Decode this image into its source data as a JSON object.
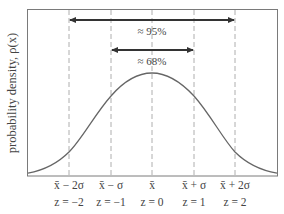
{
  "figure": {
    "y_axis_label": "probability density, ρ(x)",
    "colors": {
      "frame": "#7a7a7a",
      "curve": "#666666",
      "arrow": "#333333",
      "dashed": "#9a9a9a",
      "text": "#444444"
    },
    "annotations": [
      {
        "label": "≈ 95%",
        "from": "x̄ − 2σ",
        "to": "x̄ + 2σ"
      },
      {
        "label": "≈ 68%",
        "from": "x̄ − σ",
        "to": "x̄ + σ"
      }
    ],
    "ticks": [
      {
        "value": "x̄ − 2σ",
        "z": "z = −2"
      },
      {
        "value": "x̄ − σ",
        "z": "z = −1"
      },
      {
        "value": "x̄",
        "z": "z = 0"
      },
      {
        "value": "x̄ + σ",
        "z": "z = 1"
      },
      {
        "value": "x̄ + 2σ",
        "z": "z = 2"
      }
    ]
  }
}
